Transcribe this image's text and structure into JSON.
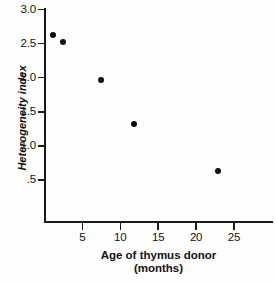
{
  "chart_data": {
    "type": "scatter",
    "title": "",
    "xlabel": "Age of thymus donor (months)",
    "xlabel_line1": "Age of thymus donor",
    "xlabel_line2": "(months)",
    "ylabel": "Heterogeneity index",
    "xlim": [
      0,
      30
    ],
    "ylim": [
      0.28,
      3.0
    ],
    "grid": false,
    "legend": "none",
    "x_ticks": [
      5,
      10,
      15,
      20,
      25
    ],
    "x_tick_labels": [
      "5",
      "10",
      "15",
      "20",
      "25"
    ],
    "y_ticks": [
      3.0,
      2.5,
      2.0,
      1.5,
      1.0,
      0.5
    ],
    "y_tick_labels": [
      "3.0",
      "2.5",
      "2.0",
      "1.5",
      "1.0",
      ".5"
    ],
    "marker": "filled-circle",
    "marker_color": "#0d0d0d",
    "points": [
      {
        "x": 1.1,
        "y": 2.63
      },
      {
        "x": 2.5,
        "y": 2.53
      },
      {
        "x": 7.4,
        "y": 1.97
      },
      {
        "x": 11.8,
        "y": 1.32
      },
      {
        "x": 22.9,
        "y": 0.63
      }
    ],
    "x": [
      1.1,
      2.5,
      7.4,
      11.8,
      22.9
    ],
    "values": [
      2.63,
      2.53,
      1.97,
      1.32,
      0.63
    ]
  },
  "colors": {
    "axis": "#1a1a1a",
    "marker": "#0d0d0d",
    "background": "#fefefe",
    "text": "#111111"
  }
}
